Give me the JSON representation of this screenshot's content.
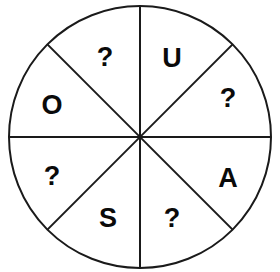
{
  "figure": {
    "name": "eight-sector-circle-puzzle",
    "type": "diagram",
    "background_color": "#ffffff",
    "stroke_color": "#1a1a1a",
    "text_color": "#0a0a0a",
    "circle": {
      "center_x": 140,
      "center_y": 137,
      "radius": 131,
      "stroke_width": 2
    },
    "divider_lines": {
      "count": 4,
      "angles_deg": [
        0,
        45,
        90,
        135
      ],
      "stroke_width": 2
    },
    "sector_count": 8
  },
  "sectors": [
    {
      "id": "sector-top-right",
      "label": "U",
      "angle_center_deg": 67.5,
      "x": 172,
      "y": 58
    },
    {
      "id": "sector-right-upper",
      "label": "?",
      "angle_center_deg": 22.5,
      "x": 228,
      "y": 98
    },
    {
      "id": "sector-right-lower",
      "label": "A",
      "angle_center_deg": -22.5,
      "x": 228,
      "y": 178
    },
    {
      "id": "sector-bottom-right",
      "label": "?",
      "angle_center_deg": -67.5,
      "x": 172,
      "y": 218
    },
    {
      "id": "sector-bottom-left",
      "label": "S",
      "angle_center_deg": 247.5,
      "x": 108,
      "y": 218
    },
    {
      "id": "sector-left-lower",
      "label": "?",
      "angle_center_deg": 202.5,
      "x": 52,
      "y": 176
    },
    {
      "id": "sector-left-upper",
      "label": "O",
      "angle_center_deg": 157.5,
      "x": 52,
      "y": 105
    },
    {
      "id": "sector-top-left",
      "label": "?",
      "angle_center_deg": 112.5,
      "x": 105,
      "y": 57
    }
  ]
}
